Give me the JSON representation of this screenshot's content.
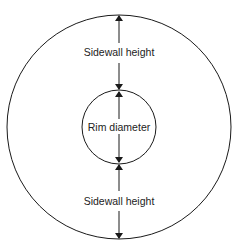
{
  "diagram": {
    "labels": {
      "sidewall_top": "Sidewall height",
      "rim": "Rim diameter",
      "sidewall_bottom": "Sidewall height"
    },
    "colors": {
      "stroke": "#1a1a1a",
      "background": "#ffffff",
      "text": "#222222"
    }
  }
}
